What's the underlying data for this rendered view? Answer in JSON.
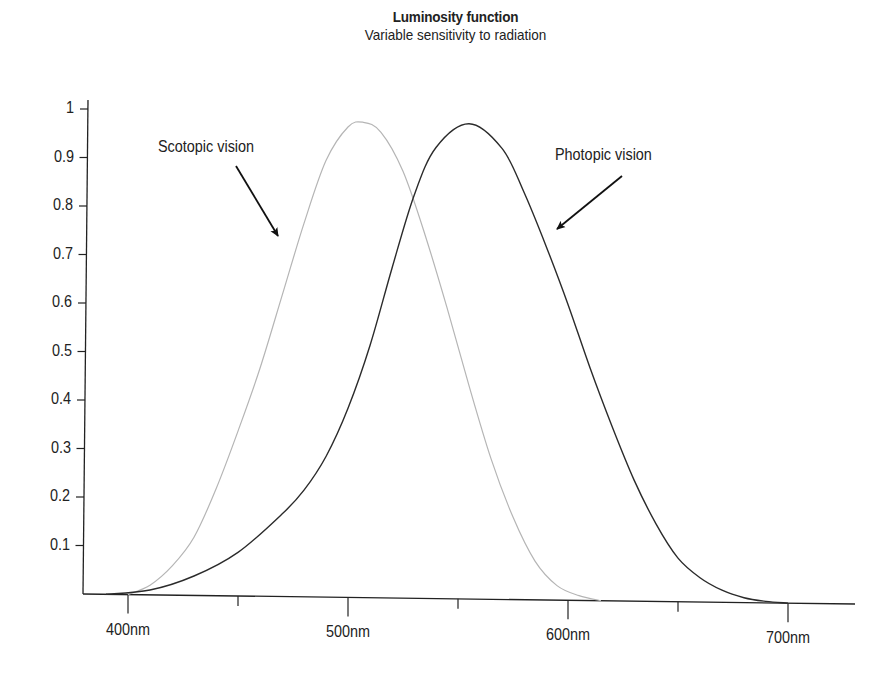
{
  "chart_data": {
    "type": "line",
    "title": "Luminosity function",
    "subtitle": "Variable sensitivity to radiation",
    "xlabel": "",
    "ylabel": "",
    "xlim": [
      380,
      730
    ],
    "ylim": [
      0,
      1
    ],
    "grid": false,
    "legend": "none (inline annotations)",
    "x_ticks": [
      {
        "value": 400,
        "label": "400nm"
      },
      {
        "value": 450,
        "label": ""
      },
      {
        "value": 500,
        "label": "500nm"
      },
      {
        "value": 550,
        "label": ""
      },
      {
        "value": 600,
        "label": "600nm"
      },
      {
        "value": 650,
        "label": ""
      },
      {
        "value": 700,
        "label": "700nm"
      }
    ],
    "y_ticks": [
      {
        "value": 0.1,
        "label": "0.1"
      },
      {
        "value": 0.2,
        "label": "0.2"
      },
      {
        "value": 0.3,
        "label": "0.3"
      },
      {
        "value": 0.4,
        "label": "0.4"
      },
      {
        "value": 0.5,
        "label": "0.5"
      },
      {
        "value": 0.6,
        "label": "0.6"
      },
      {
        "value": 0.7,
        "label": "0.7"
      },
      {
        "value": 0.8,
        "label": "0.8"
      },
      {
        "value": 0.9,
        "label": "0.9"
      },
      {
        "value": 1.0,
        "label": "1"
      }
    ],
    "series": [
      {
        "name": "Scotopic vision",
        "color": "#b5b5b5",
        "x": [
          400,
          410,
          420,
          430,
          440,
          450,
          460,
          470,
          480,
          490,
          500,
          507,
          515,
          525,
          535,
          545,
          555,
          565,
          575,
          585,
          595,
          605,
          615
        ],
        "values": [
          0.0,
          0.02,
          0.06,
          0.12,
          0.22,
          0.34,
          0.47,
          0.62,
          0.77,
          0.9,
          0.97,
          0.98,
          0.96,
          0.88,
          0.75,
          0.6,
          0.44,
          0.29,
          0.17,
          0.08,
          0.03,
          0.01,
          0.0
        ]
      },
      {
        "name": "Photopic vision",
        "color": "#2b2b2b",
        "x": [
          390,
          410,
          430,
          450,
          470,
          480,
          490,
          500,
          510,
          520,
          530,
          540,
          555,
          570,
          580,
          590,
          600,
          610,
          620,
          630,
          640,
          650,
          660,
          670,
          680,
          690,
          700
        ],
        "values": [
          0.0,
          0.01,
          0.04,
          0.09,
          0.17,
          0.22,
          0.29,
          0.39,
          0.52,
          0.68,
          0.83,
          0.93,
          0.98,
          0.93,
          0.84,
          0.73,
          0.61,
          0.48,
          0.36,
          0.25,
          0.16,
          0.09,
          0.05,
          0.025,
          0.01,
          0.003,
          0.0
        ]
      }
    ],
    "annotations": [
      {
        "text": "Scotopic vision",
        "arrow_to_nm": 468,
        "arrow_to_value": 0.73
      },
      {
        "text": "Photopic vision",
        "arrow_to_nm": 592,
        "arrow_to_value": 0.75
      }
    ]
  }
}
